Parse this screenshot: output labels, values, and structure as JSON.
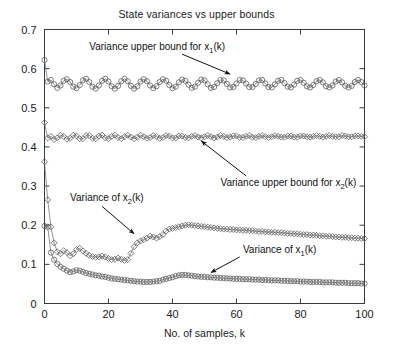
{
  "chart_data": {
    "type": "line",
    "title": "State variances vs upper bounds",
    "xlabel": "No. of samples, k",
    "ylabel": "",
    "xlim": [
      0,
      100
    ],
    "ylim": [
      0,
      0.7
    ],
    "xticks": [
      0,
      20,
      40,
      60,
      80,
      100
    ],
    "xticklabels": [
      "0",
      "20",
      "40",
      "60",
      "80",
      "100"
    ],
    "yticks": [
      0,
      0.1,
      0.2,
      0.3,
      0.4,
      0.5,
      0.6,
      0.7
    ],
    "yticklabels": [
      "0",
      "0.1",
      "0.2",
      "0.3",
      "0.4",
      "0.5",
      "0.6",
      "0.7"
    ],
    "grid": false,
    "legend": "none",
    "marker_color": "#555555",
    "line_color": "#7a7a7a",
    "annotations": [
      {
        "name": "upper-bound-x1",
        "text": "Variance upper bound for x",
        "sub": "1",
        "tail": "(k)",
        "text_x": 14,
        "text_y": 0.648,
        "arrow_from_x": 43,
        "arrow_from_y": 0.637,
        "arrow_to_x": 58,
        "arrow_to_y": 0.586
      },
      {
        "name": "upper-bound-x2",
        "text": "Variance upper bound for x",
        "sub": "2",
        "tail": "(k)",
        "text_x": 55,
        "text_y": 0.3,
        "arrow_from_x": 63,
        "arrow_from_y": 0.326,
        "arrow_to_x": 49,
        "arrow_to_y": 0.415
      },
      {
        "name": "variance-x2",
        "text": "Variance of x",
        "sub": "2",
        "tail": "(k)",
        "text_x": 8,
        "text_y": 0.262,
        "arrow_from_x": 18,
        "arrow_from_y": 0.248,
        "arrow_to_x": 28,
        "arrow_to_y": 0.178
      },
      {
        "name": "variance-x1",
        "text": "Variance of x",
        "sub": "1",
        "tail": "(k)",
        "text_x": 62,
        "text_y": 0.128,
        "arrow_from_x": 61,
        "arrow_from_y": 0.119,
        "arrow_to_x": 52,
        "arrow_to_y": 0.079
      }
    ],
    "series": [
      {
        "name": "Variance upper bound for x1(k)",
        "marker": "circle",
        "x": [
          0,
          1,
          2,
          3,
          4,
          5,
          6,
          7,
          8,
          9,
          10,
          11,
          12,
          13,
          14,
          15,
          16,
          17,
          18,
          19,
          20,
          21,
          22,
          23,
          24,
          25,
          26,
          27,
          28,
          29,
          30,
          31,
          32,
          33,
          34,
          35,
          36,
          37,
          38,
          39,
          40,
          41,
          42,
          43,
          44,
          45,
          46,
          47,
          48,
          49,
          50,
          51,
          52,
          53,
          54,
          55,
          56,
          57,
          58,
          59,
          60,
          61,
          62,
          63,
          64,
          65,
          66,
          67,
          68,
          69,
          70,
          71,
          72,
          73,
          74,
          75,
          76,
          77,
          78,
          79,
          80,
          81,
          82,
          83,
          84,
          85,
          86,
          87,
          88,
          89,
          90,
          91,
          92,
          93,
          94,
          95,
          96,
          97,
          98,
          99,
          100
        ],
        "y": [
          0.622,
          0.567,
          0.571,
          0.56,
          0.551,
          0.557,
          0.569,
          0.573,
          0.566,
          0.554,
          0.55,
          0.558,
          0.57,
          0.574,
          0.566,
          0.554,
          0.549,
          0.557,
          0.569,
          0.574,
          0.567,
          0.555,
          0.549,
          0.556,
          0.568,
          0.574,
          0.568,
          0.556,
          0.549,
          0.555,
          0.567,
          0.573,
          0.568,
          0.557,
          0.55,
          0.555,
          0.566,
          0.573,
          0.569,
          0.558,
          0.55,
          0.554,
          0.565,
          0.572,
          0.569,
          0.559,
          0.551,
          0.554,
          0.564,
          0.572,
          0.57,
          0.56,
          0.551,
          0.553,
          0.563,
          0.571,
          0.57,
          0.561,
          0.552,
          0.553,
          0.562,
          0.571,
          0.57,
          0.562,
          0.553,
          0.553,
          0.561,
          0.57,
          0.571,
          0.562,
          0.553,
          0.552,
          0.56,
          0.569,
          0.571,
          0.563,
          0.554,
          0.552,
          0.559,
          0.569,
          0.571,
          0.564,
          0.555,
          0.552,
          0.558,
          0.568,
          0.571,
          0.565,
          0.555,
          0.552,
          0.557,
          0.567,
          0.571,
          0.565,
          0.556,
          0.552,
          0.556,
          0.566,
          0.571,
          0.566,
          0.557
        ]
      },
      {
        "name": "Variance upper bound for x2(k)",
        "marker": "diamond",
        "x": [
          0,
          1,
          2,
          3,
          4,
          5,
          6,
          7,
          8,
          9,
          10,
          11,
          12,
          13,
          14,
          15,
          16,
          17,
          18,
          19,
          20,
          21,
          22,
          23,
          24,
          25,
          26,
          27,
          28,
          29,
          30,
          31,
          32,
          33,
          34,
          35,
          36,
          37,
          38,
          39,
          40,
          41,
          42,
          43,
          44,
          45,
          46,
          47,
          48,
          49,
          50,
          51,
          52,
          53,
          54,
          55,
          56,
          57,
          58,
          59,
          60,
          61,
          62,
          63,
          64,
          65,
          66,
          67,
          68,
          69,
          70,
          71,
          72,
          73,
          74,
          75,
          76,
          77,
          78,
          79,
          80,
          81,
          82,
          83,
          84,
          85,
          86,
          87,
          88,
          89,
          90,
          91,
          92,
          93,
          94,
          95,
          96,
          97,
          98,
          99,
          100
        ],
        "y": [
          0.462,
          0.423,
          0.427,
          0.419,
          0.423,
          0.43,
          0.427,
          0.42,
          0.422,
          0.43,
          0.428,
          0.421,
          0.421,
          0.429,
          0.429,
          0.422,
          0.421,
          0.428,
          0.43,
          0.423,
          0.421,
          0.427,
          0.43,
          0.424,
          0.421,
          0.426,
          0.43,
          0.425,
          0.421,
          0.425,
          0.43,
          0.426,
          0.422,
          0.424,
          0.429,
          0.427,
          0.422,
          0.424,
          0.429,
          0.428,
          0.423,
          0.423,
          0.428,
          0.428,
          0.424,
          0.423,
          0.427,
          0.429,
          0.425,
          0.423,
          0.426,
          0.429,
          0.426,
          0.423,
          0.425,
          0.429,
          0.427,
          0.424,
          0.425,
          0.428,
          0.428,
          0.424,
          0.424,
          0.427,
          0.429,
          0.425,
          0.424,
          0.427,
          0.429,
          0.426,
          0.424,
          0.426,
          0.429,
          0.427,
          0.425,
          0.425,
          0.428,
          0.428,
          0.425,
          0.425,
          0.428,
          0.428,
          0.426,
          0.425,
          0.427,
          0.429,
          0.427,
          0.425,
          0.427,
          0.429,
          0.427,
          0.426,
          0.426,
          0.429,
          0.428,
          0.426,
          0.426,
          0.428,
          0.428,
          0.427,
          0.426
        ]
      },
      {
        "name": "Variance of x2(k)",
        "marker": "diamond",
        "x": [
          0,
          1,
          2,
          3,
          4,
          5,
          6,
          7,
          8,
          9,
          10,
          11,
          12,
          13,
          14,
          15,
          16,
          17,
          18,
          19,
          20,
          21,
          22,
          23,
          24,
          25,
          26,
          27,
          28,
          29,
          30,
          31,
          32,
          33,
          34,
          35,
          36,
          37,
          38,
          39,
          40,
          41,
          42,
          43,
          44,
          45,
          46,
          47,
          48,
          49,
          50,
          51,
          52,
          53,
          54,
          55,
          56,
          57,
          58,
          59,
          60,
          61,
          62,
          63,
          64,
          65,
          66,
          67,
          68,
          69,
          70,
          71,
          72,
          73,
          74,
          75,
          76,
          77,
          78,
          79,
          80,
          81,
          82,
          83,
          84,
          85,
          86,
          87,
          88,
          89,
          90,
          91,
          92,
          93,
          94,
          95,
          96,
          97,
          98,
          99,
          100
        ],
        "y": [
          0.362,
          0.265,
          0.196,
          0.155,
          0.132,
          0.127,
          0.135,
          0.13,
          0.122,
          0.127,
          0.138,
          0.141,
          0.134,
          0.128,
          0.123,
          0.12,
          0.118,
          0.119,
          0.121,
          0.119,
          0.115,
          0.112,
          0.113,
          0.116,
          0.113,
          0.11,
          0.112,
          0.128,
          0.145,
          0.155,
          0.16,
          0.163,
          0.167,
          0.172,
          0.17,
          0.167,
          0.171,
          0.176,
          0.185,
          0.19,
          0.192,
          0.194,
          0.196,
          0.198,
          0.2,
          0.201,
          0.2,
          0.199,
          0.198,
          0.197,
          0.196,
          0.195,
          0.194,
          0.193,
          0.192,
          0.191,
          0.19,
          0.19,
          0.189,
          0.189,
          0.188,
          0.188,
          0.187,
          0.187,
          0.186,
          0.186,
          0.185,
          0.184,
          0.184,
          0.183,
          0.183,
          0.182,
          0.182,
          0.181,
          0.181,
          0.18,
          0.179,
          0.179,
          0.178,
          0.178,
          0.177,
          0.176,
          0.176,
          0.175,
          0.175,
          0.174,
          0.173,
          0.173,
          0.172,
          0.172,
          0.171,
          0.17,
          0.17,
          0.169,
          0.169,
          0.168,
          0.168,
          0.167,
          0.167,
          0.166,
          0.166
        ]
      },
      {
        "name": "Variance of x1(k)",
        "marker": "circle",
        "x": [
          0,
          1,
          2,
          3,
          4,
          5,
          6,
          7,
          8,
          9,
          10,
          11,
          12,
          13,
          14,
          15,
          16,
          17,
          18,
          19,
          20,
          21,
          22,
          23,
          24,
          25,
          26,
          27,
          28,
          29,
          30,
          31,
          32,
          33,
          34,
          35,
          36,
          37,
          38,
          39,
          40,
          41,
          42,
          43,
          44,
          45,
          46,
          47,
          48,
          49,
          50,
          51,
          52,
          53,
          54,
          55,
          56,
          57,
          58,
          59,
          60,
          61,
          62,
          63,
          64,
          65,
          66,
          67,
          68,
          69,
          70,
          71,
          72,
          73,
          74,
          75,
          76,
          77,
          78,
          79,
          80,
          81,
          82,
          83,
          84,
          85,
          86,
          87,
          88,
          89,
          90,
          91,
          92,
          93,
          94,
          95,
          96,
          97,
          98,
          99,
          100
        ],
        "y": [
          0.198,
          0.196,
          0.13,
          0.112,
          0.101,
          0.094,
          0.089,
          0.084,
          0.08,
          0.082,
          0.085,
          0.084,
          0.081,
          0.078,
          0.076,
          0.074,
          0.072,
          0.071,
          0.069,
          0.068,
          0.066,
          0.064,
          0.063,
          0.062,
          0.061,
          0.06,
          0.059,
          0.058,
          0.057,
          0.056,
          0.056,
          0.055,
          0.055,
          0.055,
          0.056,
          0.057,
          0.058,
          0.061,
          0.063,
          0.065,
          0.067,
          0.07,
          0.072,
          0.073,
          0.073,
          0.072,
          0.071,
          0.07,
          0.069,
          0.068,
          0.068,
          0.067,
          0.067,
          0.066,
          0.066,
          0.065,
          0.065,
          0.064,
          0.064,
          0.063,
          0.063,
          0.063,
          0.062,
          0.062,
          0.062,
          0.061,
          0.061,
          0.061,
          0.06,
          0.06,
          0.06,
          0.059,
          0.059,
          0.059,
          0.058,
          0.058,
          0.058,
          0.057,
          0.057,
          0.057,
          0.056,
          0.056,
          0.056,
          0.055,
          0.055,
          0.055,
          0.055,
          0.054,
          0.054,
          0.054,
          0.054,
          0.053,
          0.053,
          0.053,
          0.053,
          0.052,
          0.052,
          0.052,
          0.052,
          0.051,
          0.051
        ]
      }
    ]
  }
}
